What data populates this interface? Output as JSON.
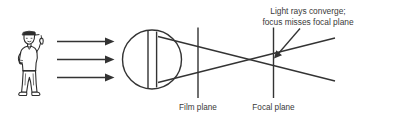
{
  "figure": {
    "background_color": "#ffffff",
    "line_color": "#333333",
    "text_color": "#3a3a3a"
  },
  "annotation": {
    "line1": "Light rays converge;",
    "line2": "focus misses focal plane",
    "arrow": "down-left-arrow"
  },
  "labels": {
    "film_plane": "Film plane",
    "focal_plane": "Focal plane"
  },
  "elements": {
    "subject": "person-figure",
    "lens": "lens-circle",
    "incoming_rays": "three-right-arrows",
    "film_plane_line": "vertical-line",
    "focal_plane_line": "vertical-line",
    "converging_rays": "crossing-ray-lines"
  }
}
